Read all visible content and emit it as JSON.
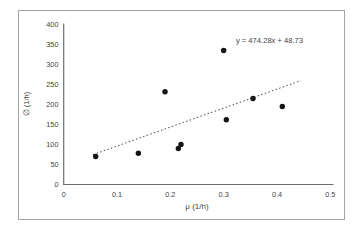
{
  "chart_data": {
    "type": "scatter",
    "title": "",
    "xlabel": "μ (1/h)",
    "ylabel": "∅ (1/h)",
    "xlim": [
      0,
      0.5
    ],
    "ylim": [
      0,
      400
    ],
    "grid": false,
    "xtick_values": [
      0,
      0.1,
      0.2,
      0.3,
      0.4,
      0.5
    ],
    "xtick_labels": [
      "0",
      "0.1",
      "0.2",
      "0.3",
      "0.4",
      "0.5"
    ],
    "ytick_values": [
      0,
      50,
      100,
      150,
      200,
      250,
      300,
      350,
      400
    ],
    "ytick_labels": [
      "0",
      "50",
      "100",
      "150",
      "200",
      "250",
      "300",
      "350",
      "400"
    ],
    "points": [
      {
        "x": 0.06,
        "y": 70
      },
      {
        "x": 0.14,
        "y": 78
      },
      {
        "x": 0.19,
        "y": 232
      },
      {
        "x": 0.215,
        "y": 90
      },
      {
        "x": 0.22,
        "y": 100
      },
      {
        "x": 0.3,
        "y": 335
      },
      {
        "x": 0.305,
        "y": 162
      },
      {
        "x": 0.355,
        "y": 215
      },
      {
        "x": 0.41,
        "y": 195
      }
    ],
    "trendline": {
      "equation": "y = 474.28x + 48.73",
      "slope": 474.28,
      "intercept": 48.73,
      "x_start": 0.055,
      "x_end": 0.445,
      "style": "dotted"
    },
    "colors": {
      "point": "#141414",
      "trendline": "#3a3a3a",
      "axis_line": "#6e6e6e",
      "tick_text": "#3f3f3f",
      "frame_border": "#a3a3a3"
    }
  }
}
